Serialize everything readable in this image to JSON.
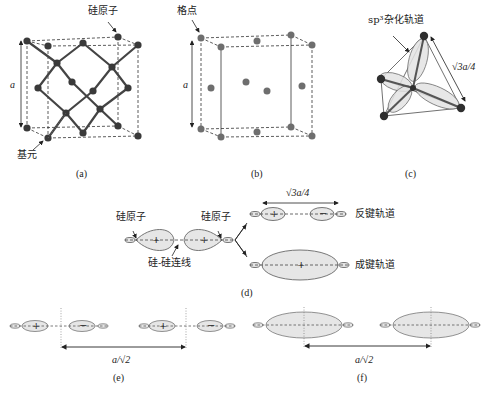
{
  "panels": {
    "a": {
      "caption": "(a)",
      "label_atom": "硅原子",
      "label_basis": "基元",
      "dim_label": "a"
    },
    "b": {
      "caption": "(b)",
      "label_lattice_point": "格点",
      "dim_label": "a"
    },
    "c": {
      "caption": "(c)",
      "label_orbital": "sp³杂化轨道",
      "dim_label": "√3a/4"
    },
    "d": {
      "caption": "(d)",
      "label_atom_left": "硅原子",
      "label_atom_right": "硅原子",
      "label_bond_line": "硅-硅连线",
      "label_antibonding": "反键轨道",
      "label_bonding": "成键轨道",
      "dim_label": "√3a/4",
      "signs": {
        "plus": "+",
        "minus": "−"
      }
    },
    "e": {
      "caption": "(e)",
      "dim_label": "a/√2"
    },
    "f": {
      "caption": "(f)",
      "dim_label": "a/√2"
    }
  },
  "colors": {
    "line": "#333333",
    "atom": "#3a3a3a",
    "lattice_point": "#6e6e6e",
    "orbital_fill": "#e6e6e6",
    "orbital_stroke": "#555555"
  }
}
